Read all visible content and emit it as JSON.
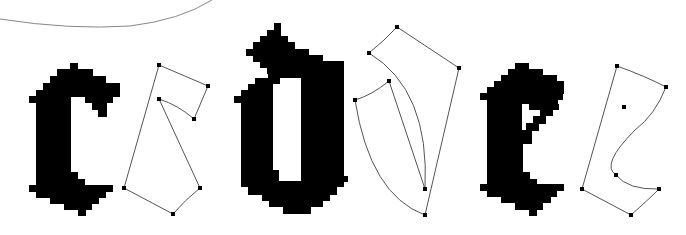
{
  "figure": {
    "glyphs": [
      {
        "letter": "c",
        "bitmap_label": "bitmap-c",
        "outline_label": "outline-c"
      },
      {
        "letter": "d",
        "bitmap_label": "bitmap-d",
        "outline_label": "outline-d"
      },
      {
        "letter": "e",
        "bitmap_label": "bitmap-e",
        "outline_label": "outline-e"
      }
    ],
    "colors": {
      "ink": "#000000",
      "outline": "#555555",
      "background": "#ffffff",
      "arc": "#888888"
    }
  }
}
